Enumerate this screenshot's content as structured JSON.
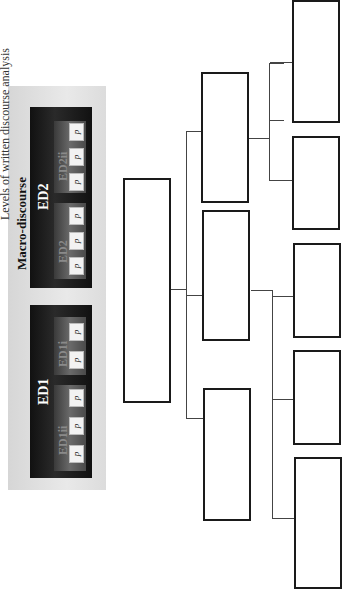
{
  "header": {
    "title": "Levels of written discourse analysis",
    "macro_label": "Macro-discourse"
  },
  "ed_blocks": [
    {
      "label": "ED2",
      "sub_units": [
        {
          "label": "ED2",
          "paragraphs": [
            "p",
            "p",
            "p"
          ]
        },
        {
          "label": "ED2ii",
          "paragraphs": [
            "p",
            "p",
            "p"
          ]
        }
      ]
    },
    {
      "label": "ED1",
      "sub_units": [
        {
          "label": "ED1i",
          "paragraphs": [
            "p",
            "p"
          ]
        },
        {
          "label": "ED1ii",
          "paragraphs": [
            "p",
            "p",
            "p"
          ]
        }
      ]
    }
  ],
  "tree": {
    "node_count": 9,
    "levels": 4,
    "labels": [
      "",
      "",
      "",
      "",
      "",
      "",
      "",
      "",
      ""
    ]
  },
  "colors": {
    "ed_block_bg": "#141414",
    "panel_bg": "#e0e0e0",
    "box_border": "#1a1a1a",
    "connector": "#444444"
  }
}
